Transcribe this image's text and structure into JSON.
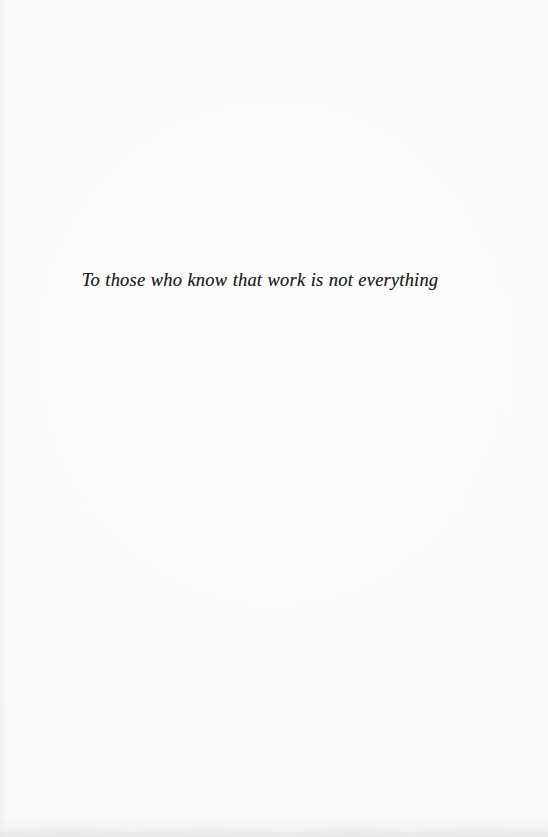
{
  "document": {
    "page_type": "dedication",
    "background_color": "#fcfcfc",
    "text_color": "#1b1b1b"
  },
  "dedication": {
    "text": "To those who know that work is not everything"
  }
}
